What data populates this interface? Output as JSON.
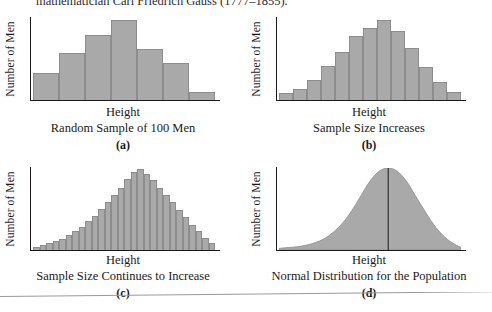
{
  "page": {
    "running_text": "mathematician Carl Friedrich Gauss (1777–1855).",
    "background_color": "#ffffff",
    "ink_color": "#1a1a1a",
    "fill_color": "#a9a9a9",
    "stroke_color": "#8d8d8d"
  },
  "panels": [
    {
      "letter": "(a)",
      "ylabel": "Number of Men",
      "xlabel": "Height",
      "title": "Random Sample of 100 Men"
    },
    {
      "letter": "(b)",
      "ylabel": "Number of Men",
      "xlabel": "Height",
      "title": "Sample Size Increases"
    },
    {
      "letter": "(c)",
      "ylabel": "Number of Men",
      "xlabel": "Height",
      "title": "Sample Size Continues to Increase"
    },
    {
      "letter": "(d)",
      "ylabel": "Number of Men",
      "xlabel": "Height",
      "title": "Normal Distribution for the Population"
    }
  ],
  "chart_data": [
    {
      "type": "bar",
      "title": "Random Sample of 100 Men",
      "subtitle": "(a)",
      "xlabel": "Height",
      "ylabel": "Number of Men",
      "grid": false,
      "legend": false,
      "ylim": [
        0,
        100
      ],
      "categories": [
        "1",
        "2",
        "3",
        "4",
        "5",
        "6",
        "7"
      ],
      "values": [
        33,
        57,
        79,
        97,
        62,
        45,
        10
      ]
    },
    {
      "type": "bar",
      "title": "Sample Size Increases",
      "subtitle": "(b)",
      "xlabel": "Height",
      "ylabel": "Number of Men",
      "grid": false,
      "legend": false,
      "ylim": [
        0,
        100
      ],
      "categories": [
        "1",
        "2",
        "3",
        "4",
        "5",
        "6",
        "7",
        "8",
        "9",
        "10",
        "11",
        "12",
        "13"
      ],
      "values": [
        8,
        14,
        24,
        41,
        58,
        78,
        88,
        97,
        84,
        64,
        40,
        22,
        10
      ]
    },
    {
      "type": "bar",
      "title": "Sample Size Continues to Increase",
      "subtitle": "(c)",
      "xlabel": "Height",
      "ylabel": "Number of Men",
      "grid": false,
      "legend": false,
      "ylim": [
        0,
        100
      ],
      "categories": [
        "1",
        "2",
        "3",
        "4",
        "5",
        "6",
        "7",
        "8",
        "9",
        "10",
        "11",
        "12",
        "13",
        "14",
        "15",
        "16",
        "17",
        "18",
        "19",
        "20",
        "21",
        "22",
        "23",
        "24",
        "25",
        "26",
        "27",
        "28"
      ],
      "values": [
        4,
        6,
        8,
        11,
        14,
        18,
        23,
        28,
        35,
        42,
        50,
        58,
        67,
        76,
        86,
        95,
        99,
        93,
        85,
        76,
        67,
        58,
        49,
        40,
        31,
        23,
        15,
        8
      ]
    },
    {
      "type": "area",
      "title": "Normal Distribution for the Population",
      "subtitle": "(d)",
      "xlabel": "Height",
      "ylabel": "Number of Men",
      "grid": false,
      "legend": false,
      "ylim": [
        0,
        100
      ],
      "center_line": true,
      "x": [
        0,
        5,
        10,
        15,
        20,
        25,
        30,
        35,
        40,
        45,
        50,
        55,
        60,
        65,
        70,
        75,
        80,
        85,
        90,
        95,
        100
      ],
      "y": [
        2,
        3,
        4,
        6,
        9,
        14,
        22,
        33,
        48,
        66,
        84,
        96,
        100,
        96,
        84,
        66,
        48,
        31,
        18,
        9,
        3
      ]
    }
  ]
}
